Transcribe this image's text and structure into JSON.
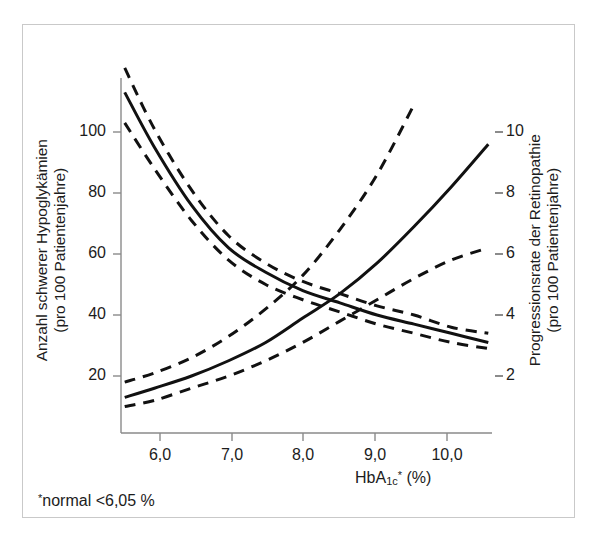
{
  "chart_data": {
    "type": "line",
    "title": "",
    "subtitle": "",
    "xlabel": "HbA1c* (%)",
    "xlabel_parts": {
      "base": "HbA",
      "sub": "1c",
      "sup": "*",
      "suffix": " (%)"
    },
    "xlim": [
      5.55,
      10.55
    ],
    "xticks": [
      6.0,
      7.0,
      8.0,
      9.0,
      10.0
    ],
    "xticklabels": [
      "6,0",
      "7,0",
      "8,0",
      "9,0",
      "10,0"
    ],
    "grid": false,
    "legend": "none",
    "footnote": "*normal <6,05%",
    "footnote_parts": {
      "marker": "*",
      "text": "normal <6,05 %"
    },
    "axes": [
      {
        "side": "left",
        "label_line1": "Anzahl schwerer Hypoglykämien",
        "label_line2": "(pro 100 Patientenjahre)",
        "ylim": [
          0,
          125
        ],
        "yticks": [
          20,
          40,
          60,
          80,
          100
        ],
        "yticklabels": [
          "20",
          "40",
          "60",
          "80",
          "100"
        ]
      },
      {
        "side": "right",
        "label_line1": "Progressionsrate der Retinopathie",
        "label_line2": "(pro 100 Patientenjahre)",
        "ylim": [
          0,
          11.6
        ],
        "yticks": [
          2,
          4,
          6,
          8,
          10
        ],
        "yticklabels": [
          "2",
          "4",
          "6",
          "8",
          "10"
        ]
      }
    ],
    "series": [
      {
        "name": "Schwere Hypoglykämien",
        "axis": "left",
        "style": "solid",
        "color": "#111111",
        "x": [
          5.6,
          6.0,
          6.5,
          7.0,
          7.5,
          8.0,
          8.5,
          9.0,
          9.5,
          10.0,
          10.5
        ],
        "values": [
          113,
          95,
          76,
          62,
          54,
          48,
          44,
          40,
          37,
          34,
          31
        ]
      },
      {
        "name": "Schwere Hypoglykämien obere Vertrauensgrenze",
        "axis": "left",
        "style": "dashed",
        "color": "#111111",
        "x": [
          5.6,
          6.0,
          6.5,
          7.0,
          7.5,
          8.0,
          8.5,
          9.0,
          9.5,
          10.0,
          10.5
        ],
        "values": [
          121,
          101,
          81,
          66,
          57,
          51,
          47,
          43,
          40,
          36,
          34
        ]
      },
      {
        "name": "Schwere Hypoglykämien untere Vertrauensgrenze",
        "axis": "left",
        "style": "dashed",
        "color": "#111111",
        "x": [
          5.6,
          6.0,
          6.5,
          7.0,
          7.5,
          8.0,
          8.5,
          9.0,
          9.5,
          10.0,
          10.5
        ],
        "values": [
          103,
          88,
          71,
          58,
          50,
          45,
          41,
          37,
          34,
          31,
          29
        ]
      },
      {
        "name": "Progressionsrate der Retinopathie",
        "axis": "right",
        "style": "solid",
        "color": "#111111",
        "x": [
          5.6,
          6.0,
          6.5,
          7.0,
          7.5,
          8.0,
          8.5,
          9.0,
          9.5,
          10.0,
          10.5
        ],
        "values": [
          1.3,
          1.6,
          2.0,
          2.5,
          3.1,
          3.9,
          4.7,
          5.7,
          6.9,
          8.2,
          9.6
        ]
      },
      {
        "name": "Retinopathie obere Vertrauensgrenze",
        "axis": "right",
        "style": "dashed",
        "color": "#111111",
        "x": [
          5.6,
          6.0,
          6.5,
          7.0,
          7.5,
          8.0,
          8.5,
          9.0,
          9.5
        ],
        "values": [
          1.8,
          2.1,
          2.6,
          3.3,
          4.2,
          5.3,
          6.8,
          8.6,
          10.9
        ]
      },
      {
        "name": "Retinopathie untere Vertrauensgrenze",
        "axis": "right",
        "style": "dashed",
        "color": "#111111",
        "x": [
          5.6,
          6.0,
          6.5,
          7.0,
          7.5,
          8.0,
          8.5,
          9.0,
          9.5,
          10.0,
          10.5
        ],
        "values": [
          1.0,
          1.2,
          1.6,
          2.0,
          2.5,
          3.1,
          3.8,
          4.5,
          5.2,
          5.8,
          6.2
        ]
      }
    ]
  }
}
